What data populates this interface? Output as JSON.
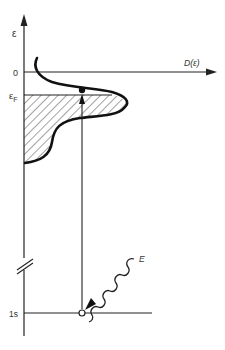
{
  "diagram": {
    "type": "energy-level / density-of-states schematic (X-ray absorption)",
    "axes": {
      "vertical_label": "ε",
      "horizontal_label": "D(ε)",
      "zero_label": "0",
      "fermi_label_main": "ε",
      "fermi_label_sub": "F"
    },
    "levels": {
      "core_label": "1s"
    },
    "photon": {
      "label": "E"
    },
    "colors": {
      "line": "#222222",
      "text": "#333333",
      "background": "#ffffff"
    }
  }
}
